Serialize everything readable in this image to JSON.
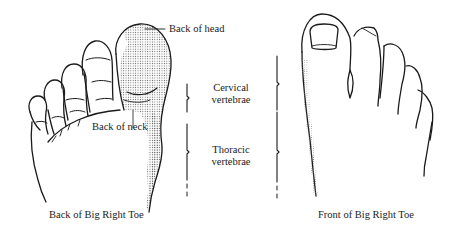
{
  "diagram": {
    "left_panel": {
      "caption": "Back of Big Right Toe",
      "labels": {
        "head": "Back of head",
        "neck": "Back of neck"
      }
    },
    "middle_labels": {
      "cervical_line1": "Cervical",
      "cervical_line2": "vertebrae",
      "thoracic_line1": "Thoracic",
      "thoracic_line2": "vertebrae"
    },
    "right_panel": {
      "caption": "Front of Big Right Toe"
    },
    "colors": {
      "line": "#1a1a1a",
      "text": "#222222",
      "stipple": "#555555",
      "background": "#ffffff"
    }
  }
}
